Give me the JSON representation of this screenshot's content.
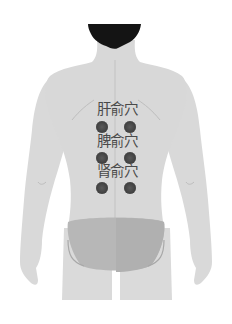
{
  "figure": {
    "colors": {
      "background": "#ffffff",
      "skin": "#d8d8d8",
      "skin_shade": "#cfcfcf",
      "hair": "#151515",
      "underwear": "#b5b5b5",
      "dot": "#444444",
      "label_text": "#4a4a4a"
    }
  },
  "acupoints": [
    {
      "label": "肝俞穴",
      "label_y": 101,
      "dots_y": 119
    },
    {
      "label": "脾俞穴",
      "label_y": 133,
      "dots_y": 150
    },
    {
      "label": "肾俞穴",
      "label_y": 163,
      "dots_y": 180
    }
  ]
}
